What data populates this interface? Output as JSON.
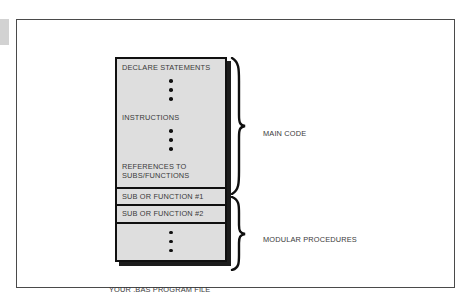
{
  "diagram": {
    "file_caption": "YOUR .BAS PROGRAM FILE",
    "blocks": [
      {
        "id": "main-code",
        "labels": [
          "DECLARE STATEMENTS",
          "INSTRUCTIONS",
          "REFERENCES TO",
          "SUBS/FUNCTIONS"
        ],
        "ellipsis_groups": 2,
        "dots_per_group": 3
      },
      {
        "id": "sub-1",
        "labels": [
          "SUB OR FUNCTION #1"
        ]
      },
      {
        "id": "sub-2",
        "labels": [
          "SUB OR FUNCTION #2"
        ]
      },
      {
        "id": "more-procedures",
        "labels": [],
        "ellipsis_groups": 1,
        "dots_per_group": 3
      }
    ],
    "group_labels": [
      {
        "id": "main-code",
        "text": "MAIN CODE"
      },
      {
        "id": "modular-procedures",
        "text": "MODULAR PROCEDURES"
      }
    ],
    "colors": {
      "block_fill": "#dedede",
      "block_border": "#101010",
      "shadow": "#1c1c1c",
      "text": "#3a3a3a",
      "frame": "#4a4a4a",
      "page_background": "#ffffff"
    }
  }
}
